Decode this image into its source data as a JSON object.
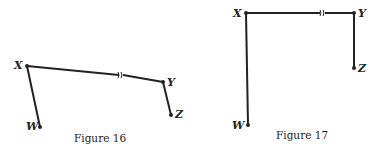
{
  "figures": [
    {
      "caption": "Figure 16",
      "points": {
        "X": "X",
        "Y": "Y",
        "Z": "Z",
        "W": "W"
      }
    },
    {
      "caption": "Figure 17",
      "points": {
        "X": "X",
        "Y": "Y",
        "Z": "Z",
        "W": "W"
      }
    }
  ],
  "colors": {
    "ink": "#222222",
    "background": "#ffffff"
  }
}
